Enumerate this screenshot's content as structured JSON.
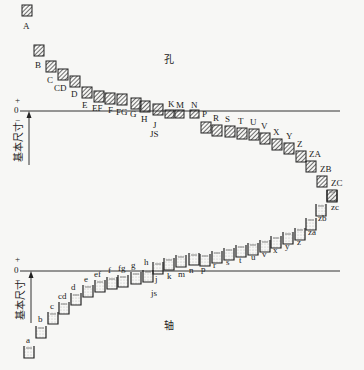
{
  "hole": {
    "title": "孔",
    "axis_plus": "+",
    "axis_zero": "0",
    "axis_minus": "−",
    "axis_label": "基本尺寸",
    "boxes": [
      {
        "label": "A",
        "x": 22,
        "y": 5,
        "lx": 23,
        "ly": 29
      },
      {
        "label": "B",
        "x": 34,
        "y": 45,
        "lx": 35,
        "ly": 68
      },
      {
        "label": "C",
        "x": 46,
        "y": 61,
        "lx": 47,
        "ly": 83
      },
      {
        "label": "CD",
        "x": 58,
        "y": 69,
        "lx": 54,
        "ly": 91
      },
      {
        "label": "D",
        "x": 70,
        "y": 76,
        "lx": 71,
        "ly": 97
      },
      {
        "label": "E",
        "x": 82,
        "y": 87,
        "lx": 82,
        "ly": 108
      },
      {
        "label": "EF",
        "x": 94,
        "y": 91,
        "lx": 92,
        "ly": 111
      },
      {
        "label": "F",
        "x": 105,
        "y": 93,
        "lx": 108,
        "ly": 113
      },
      {
        "label": "FG",
        "x": 117,
        "y": 94,
        "lx": 116,
        "ly": 115
      },
      {
        "label": "G",
        "x": 131,
        "y": 98,
        "lx": 130,
        "ly": 117
      },
      {
        "label": "H",
        "x": 140,
        "y": 101,
        "lx": 141,
        "ly": 122
      },
      {
        "label": "J",
        "x": 153,
        "y": 104,
        "lx": 153,
        "ly": 128
      },
      {
        "label": "K",
        "x": 165,
        "y": 110,
        "lx": 168,
        "ly": 107
      },
      {
        "label": "M",
        "x": 175,
        "y": 110,
        "lx": 176,
        "ly": 108
      },
      {
        "label": "N",
        "x": 190,
        "y": 110,
        "lx": 191,
        "ly": 108
      },
      {
        "label": "P",
        "x": 201,
        "y": 122,
        "lx": 202,
        "ly": 117
      },
      {
        "label": "R",
        "x": 212,
        "y": 125,
        "lx": 213,
        "ly": 121
      },
      {
        "label": "S",
        "x": 225,
        "y": 126,
        "lx": 225,
        "ly": 122
      },
      {
        "label": "T",
        "x": 237,
        "y": 128,
        "lx": 238,
        "ly": 124
      },
      {
        "label": "U",
        "x": 249,
        "y": 129,
        "lx": 250,
        "ly": 125
      },
      {
        "label": "V",
        "x": 260,
        "y": 133,
        "lx": 261,
        "ly": 129
      },
      {
        "label": "X",
        "x": 272,
        "y": 139,
        "lx": 273,
        "ly": 135
      },
      {
        "label": "Y",
        "x": 284,
        "y": 143,
        "lx": 286,
        "ly": 139
      },
      {
        "label": "Z",
        "x": 296,
        "y": 151,
        "lx": 297,
        "ly": 147
      },
      {
        "label": "ZA",
        "x": 306,
        "y": 161,
        "lx": 309,
        "ly": 157
      },
      {
        "label": "ZB",
        "x": 317,
        "y": 176,
        "lx": 320,
        "ly": 172
      },
      {
        "label": "ZC",
        "x": 327,
        "y": 190,
        "lx": 331,
        "ly": 186
      }
    ],
    "js_label": {
      "label": "JS",
      "x": 150,
      "y": 137
    }
  },
  "shaft": {
    "title": "轴",
    "axis_plus": "+",
    "axis_zero": "0",
    "axis_minus": "−",
    "axis_label": "基本尺寸",
    "boxes": [
      {
        "label": "a",
        "x": 24,
        "y": 346,
        "lx": 26,
        "ly": 343
      },
      {
        "label": "b",
        "x": 36,
        "y": 326,
        "lx": 38,
        "ly": 322
      },
      {
        "label": "c",
        "x": 48,
        "y": 312,
        "lx": 50,
        "ly": 309
      },
      {
        "label": "cd",
        "x": 59,
        "y": 302,
        "lx": 58,
        "ly": 299
      },
      {
        "label": "d",
        "x": 71,
        "y": 293,
        "lx": 71,
        "ly": 290
      },
      {
        "label": "e",
        "x": 83,
        "y": 285,
        "lx": 84,
        "ly": 282
      },
      {
        "label": "ef",
        "x": 95,
        "y": 280,
        "lx": 94,
        "ly": 277
      },
      {
        "label": "f",
        "x": 107,
        "y": 277,
        "lx": 108,
        "ly": 273
      },
      {
        "label": "fg",
        "x": 118,
        "y": 275,
        "lx": 118,
        "ly": 271
      },
      {
        "label": "g",
        "x": 131,
        "y": 272,
        "lx": 131,
        "ly": 268
      },
      {
        "label": "h",
        "x": 143,
        "y": 270,
        "lx": 144,
        "ly": 265
      },
      {
        "label": "j",
        "x": 153,
        "y": 262,
        "lx": 155,
        "ly": 282
      },
      {
        "label": "k",
        "x": 164,
        "y": 258,
        "lx": 167,
        "ly": 279
      },
      {
        "label": "m",
        "x": 176,
        "y": 255,
        "lx": 178,
        "ly": 277
      },
      {
        "label": "n",
        "x": 189,
        "y": 253,
        "lx": 189,
        "ly": 273
      },
      {
        "label": "p",
        "x": 200,
        "y": 254,
        "lx": 201,
        "ly": 272
      },
      {
        "label": "r",
        "x": 212,
        "y": 251,
        "lx": 213,
        "ly": 268
      },
      {
        "label": "s",
        "x": 224,
        "y": 248,
        "lx": 226,
        "ly": 265
      },
      {
        "label": "t",
        "x": 236,
        "y": 245,
        "lx": 239,
        "ly": 263
      },
      {
        "label": "u",
        "x": 248,
        "y": 243,
        "lx": 251,
        "ly": 260
      },
      {
        "label": "v",
        "x": 260,
        "y": 240,
        "lx": 262,
        "ly": 257
      },
      {
        "label": "x",
        "x": 271,
        "y": 236,
        "lx": 273,
        "ly": 253
      },
      {
        "label": "y",
        "x": 283,
        "y": 232,
        "lx": 285,
        "ly": 249
      },
      {
        "label": "z",
        "x": 295,
        "y": 228,
        "lx": 297,
        "ly": 245
      },
      {
        "label": "za",
        "x": 306,
        "y": 218,
        "lx": 308,
        "ly": 235
      },
      {
        "label": "zb",
        "x": 316,
        "y": 204,
        "lx": 318,
        "ly": 221
      },
      {
        "label": "zc",
        "x": 327,
        "y": 190,
        "lx": 331,
        "ly": 210
      }
    ],
    "js_label": {
      "label": "js",
      "x": 151,
      "y": 296
    }
  },
  "colors": {
    "background": "#f7f7f5",
    "ink": "#222222",
    "line": "#333333",
    "dot_fill": "#bbbbbb"
  }
}
